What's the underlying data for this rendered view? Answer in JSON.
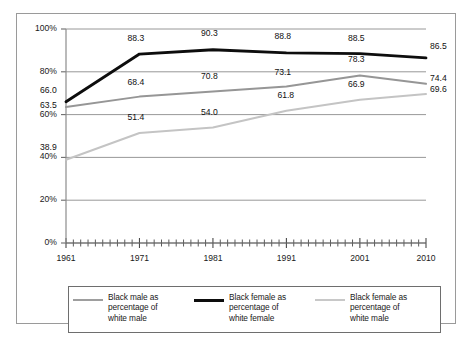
{
  "chart_data": {
    "type": "line",
    "title": "",
    "subtitle": "",
    "xlabel": "",
    "ylabel": "",
    "grid": true,
    "legend_position": "bottom",
    "xlim": [
      1961,
      2010
    ],
    "ylim": [
      0,
      100
    ],
    "x_tick_labels": [
      "1961",
      "1971",
      "1981",
      "1991",
      "2001",
      "2010"
    ],
    "x_tick_values": [
      1961,
      1971,
      1981,
      1991,
      2001,
      2010
    ],
    "y_tick_labels": [
      "0%",
      "20%",
      "40%",
      "60%",
      "80%",
      "100%"
    ],
    "y_tick_values": [
      0,
      20,
      40,
      60,
      80,
      100
    ],
    "x": [
      1961,
      1971,
      1981,
      1991,
      2001,
      2010
    ],
    "series": [
      {
        "name": "Black male as percentage of white male",
        "color": "#969696",
        "width": 2.0,
        "values": [
          63.5,
          68.4,
          70.8,
          73.1,
          78.3,
          74.4
        ],
        "labels": [
          "63.5",
          "68.4",
          "70.8",
          "73.1",
          "78.3",
          "74.4"
        ]
      },
      {
        "name": "Black female as percentage of white female",
        "color": "#0d0d0d",
        "width": 2.8,
        "values": [
          66.0,
          88.3,
          90.3,
          88.8,
          88.5,
          86.5
        ],
        "labels": [
          "66.0",
          "88.3",
          "90.3",
          "88.8",
          "88.5",
          "86.5"
        ]
      },
      {
        "name": "Black female as percentage of white male",
        "color": "#c4c4c4",
        "width": 2.0,
        "values": [
          38.9,
          51.4,
          54.0,
          61.8,
          66.9,
          69.6
        ],
        "labels": [
          "38.9",
          "51.4",
          "54.0",
          "61.8",
          "66.9",
          "69.6"
        ]
      }
    ]
  },
  "legend": {
    "entries": [
      {
        "label": "Black male as\npercentage of\nwhite male",
        "color": "#9e9e9e",
        "thickness": "2px"
      },
      {
        "label": "Black female as\npercentage of\nwhite female",
        "color": "#0d0d0d",
        "thickness": "3px"
      },
      {
        "label": "Black female as\npercentage of\nwhite male",
        "color": "#c8c8c8",
        "thickness": "2px"
      }
    ]
  },
  "axes": {
    "y_ticks": [
      "100%",
      "80%",
      "60%",
      "40%",
      "20%",
      "0%"
    ],
    "x_ticks": [
      "1961",
      "1971",
      "1981",
      "1991",
      "2001",
      "2010"
    ]
  },
  "point_labels": {
    "black_female_white_female": [
      "66.0",
      "88.3",
      "90.3",
      "88.8",
      "88.5",
      "86.5"
    ],
    "black_male_white_male": [
      "63.5",
      "68.4",
      "70.8",
      "73.1",
      "78.3",
      "74.4"
    ],
    "black_female_white_male": [
      "38.9",
      "51.4",
      "54.0",
      "61.8",
      "66.9",
      "69.6"
    ]
  }
}
